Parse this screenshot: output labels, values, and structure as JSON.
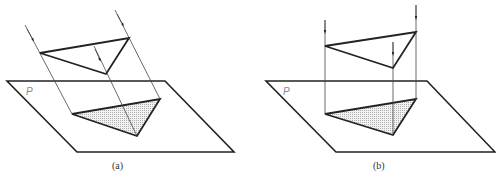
{
  "figure": {
    "colors": {
      "stroke": "#222222",
      "projection_line": "#444444",
      "shade": "#d9d9d9",
      "plane_label": "#888888"
    },
    "panels": [
      {
        "caption": "(a)",
        "plane_label": "P",
        "projection": "oblique"
      },
      {
        "caption": "(b)",
        "plane_label": "P",
        "projection": "orthogonal"
      }
    ]
  }
}
